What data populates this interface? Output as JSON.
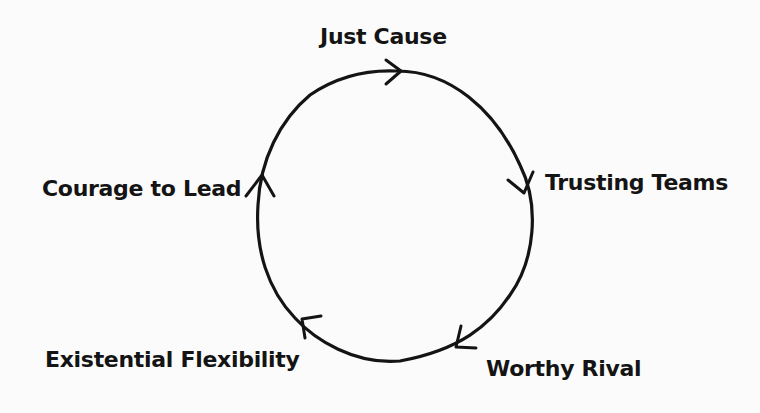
{
  "diagram": {
    "type": "cycle",
    "direction": "clockwise",
    "nodes": [
      {
        "id": "just-cause",
        "label": "Just Cause",
        "position": "top"
      },
      {
        "id": "trusting-teams",
        "label": "Trusting Teams",
        "position": "right"
      },
      {
        "id": "worthy-rival",
        "label": "Worthy Rival",
        "position": "bottom-right"
      },
      {
        "id": "existential-flexibility",
        "label": "Existential Flexibility",
        "position": "bottom-left"
      },
      {
        "id": "courage-to-lead",
        "label": "Courage to Lead",
        "position": "left"
      }
    ],
    "edges": [
      {
        "from": "courage-to-lead",
        "to": "just-cause"
      },
      {
        "from": "just-cause",
        "to": "trusting-teams"
      },
      {
        "from": "trusting-teams",
        "to": "worthy-rival"
      },
      {
        "from": "worthy-rival",
        "to": "existential-flexibility"
      },
      {
        "from": "existential-flexibility",
        "to": "courage-to-lead"
      }
    ],
    "colors": {
      "background": "#fbfbfb",
      "stroke": "#141414"
    }
  }
}
